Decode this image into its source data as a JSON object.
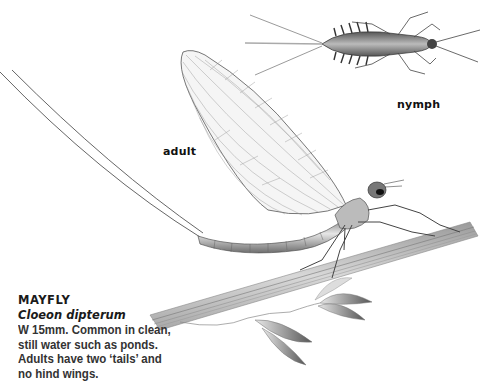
{
  "labels": {
    "adult": "adult",
    "nymph": "nymph"
  },
  "caption": {
    "title": "MAYFLY",
    "scientific_name": "Cloeon dipterum",
    "description_lines": [
      "W 15mm. Common in clean,",
      "still water such as ponds.",
      "Adults have two ‘tails’ and",
      "no hind wings."
    ]
  },
  "illustration": {
    "subjects": [
      "mayfly-adult",
      "mayfly-nymph",
      "grass-stem",
      "grass-seedhead"
    ],
    "colors": {
      "background": "#ffffff",
      "wing_fill": "#f4f4f4",
      "body": "#9a9a9a",
      "ink": "#333333",
      "stem": "#b5b5b5"
    }
  }
}
